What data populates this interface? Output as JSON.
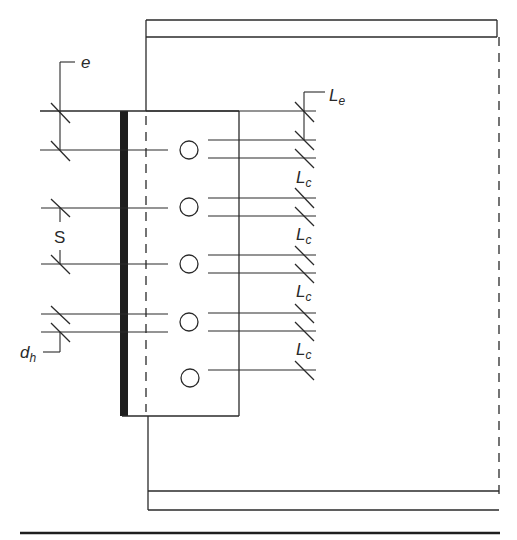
{
  "diagram": {
    "type": "bolted-shear-connection",
    "labels": {
      "edge_distance": "e",
      "spacing": "S",
      "hole_diameter_main": "d",
      "hole_diameter_sub": "h",
      "end_clear_main": "L",
      "end_clear_sub": "e",
      "clear_main": "L",
      "clear_sub": "c"
    },
    "bolt_count": 5,
    "colors": {
      "line": "#2a2a2a",
      "background": "#ffffff"
    }
  }
}
